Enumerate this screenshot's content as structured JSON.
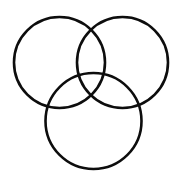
{
  "figure": {
    "background_color": "#ffffff",
    "stroke_color": "#0d0d0d",
    "stroke_width": 2.6,
    "canvas": {
      "width": 182,
      "height": 175
    },
    "shapes": [
      {
        "name": "upper-left-circle",
        "type": "circle",
        "cx": 59.5,
        "cy": 62.5,
        "r": 45.5,
        "label": "Upper left circle"
      },
      {
        "name": "upper-right-circle",
        "type": "circle",
        "cx": 122.5,
        "cy": 62.5,
        "r": 45.5,
        "label": "Upper right circle"
      },
      {
        "name": "bottom-circle",
        "type": "circle",
        "cx": 93.5,
        "cy": 121.0,
        "r": 48.0,
        "label": "Bottom circle"
      }
    ]
  }
}
